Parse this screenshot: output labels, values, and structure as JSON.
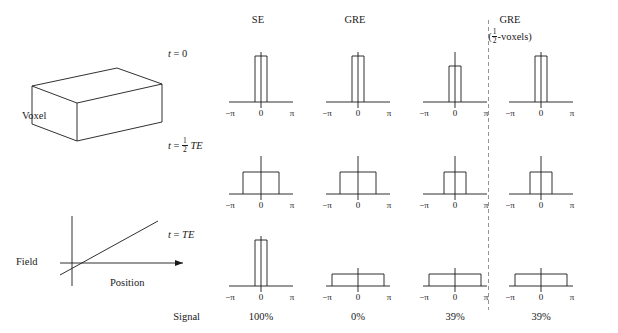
{
  "figure": {
    "columns": [
      {
        "id": "se",
        "title": "SE",
        "subtitle": ""
      },
      {
        "id": "gre",
        "title": "GRE",
        "subtitle": ""
      },
      {
        "id": "gre2",
        "title": "GRE",
        "subtitle": "(½-voxels)"
      },
      {
        "id": "gre3",
        "title": "",
        "subtitle": ""
      }
    ],
    "column_titles": {
      "se": "SE",
      "gre": "GRE",
      "gre_half": "GRE",
      "gre_half_sub": "(½-voxels)"
    },
    "rows": [
      {
        "id": "t0",
        "label_prefix": "t",
        "label_eq": " = ",
        "label_value": "0"
      },
      {
        "id": "thalf",
        "label_prefix": "t",
        "label_eq": " = ",
        "label_value": "½ TE"
      },
      {
        "id": "tte",
        "label_prefix": "t",
        "label_eq": " = ",
        "label_value": "TE"
      }
    ],
    "axis_ticks": {
      "left": "−π",
      "center": "0",
      "right": "π"
    },
    "signal_label": "Signal",
    "signal_values": [
      "100%",
      "0%",
      "39%",
      "39%"
    ],
    "voxel_label": "Voxel",
    "field_label": "Field",
    "position_label": "Position",
    "colors": {
      "stroke": "#1a1a1a",
      "dashed_divider": "#7a7a7a",
      "background": "#ffffff"
    },
    "plots": [
      {
        "column": "se",
        "row": "t0",
        "shape": "narrow-spike",
        "half_width": 4,
        "height": 46
      },
      {
        "column": "gre",
        "row": "t0",
        "shape": "narrow-spike",
        "half_width": 4,
        "height": 46
      },
      {
        "column": "gre2",
        "row": "t0",
        "shape": "narrow-spike",
        "half_width": 4,
        "height": 36
      },
      {
        "column": "gre3",
        "row": "t0",
        "shape": "narrow-spike",
        "half_width": 4,
        "height": 46
      },
      {
        "column": "se",
        "row": "thalf",
        "shape": "wide-block",
        "half_width": 18,
        "height": 22
      },
      {
        "column": "gre",
        "row": "thalf",
        "shape": "wide-block",
        "half_width": 18,
        "height": 22
      },
      {
        "column": "gre2",
        "row": "thalf",
        "shape": "wide-block",
        "half_width": 11,
        "height": 22
      },
      {
        "column": "gre3",
        "row": "thalf",
        "shape": "wide-block",
        "half_width": 11,
        "height": 22
      },
      {
        "column": "se",
        "row": "tte",
        "shape": "narrow-spike",
        "half_width": 4,
        "height": 46
      },
      {
        "column": "gre",
        "row": "tte",
        "shape": "flat-wide",
        "half_width": 26,
        "height": 12
      },
      {
        "column": "gre2",
        "row": "tte",
        "shape": "flat-wide",
        "half_width": 26,
        "height": 12
      },
      {
        "column": "gre3",
        "row": "tte",
        "shape": "flat-wide",
        "half_width": 26,
        "height": 12
      }
    ]
  }
}
